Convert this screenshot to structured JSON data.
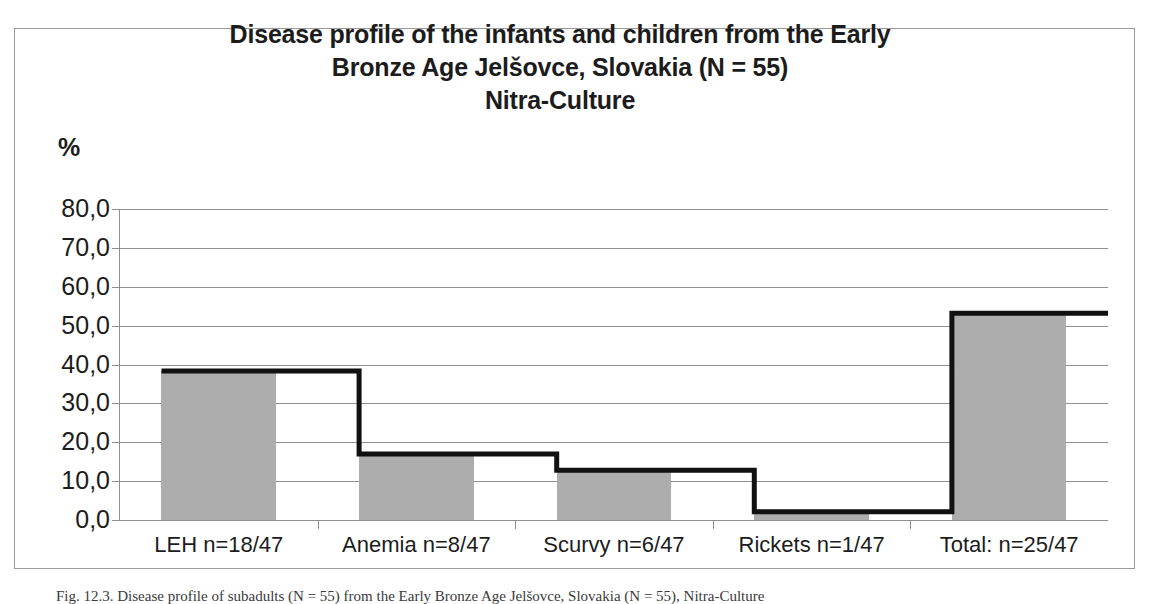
{
  "chart_data": {
    "type": "bar",
    "title": "Disease profile of the infants and children from the Early Bronze Age Jelšovce, Slovakia (N = 55) Nitra-Culture",
    "title_lines": [
      "Disease profile of the infants and children from the Early",
      "Bronze Age Jelšovce, Slovakia (N = 55)",
      "Nitra-Culture"
    ],
    "xlabel": "",
    "ylabel": "%",
    "ylim": [
      0,
      80
    ],
    "ytick_labels": [
      "80,0",
      "70,0",
      "60,0",
      "50,0",
      "40,0",
      "30,0",
      "20,0",
      "10,0",
      "0,0"
    ],
    "ytick_values": [
      80,
      70,
      60,
      50,
      40,
      30,
      20,
      10,
      0
    ],
    "grid": true,
    "legend": "none",
    "categories": [
      "LEH n=18/47",
      "Anemia n=8/47",
      "Scurvy n=6/47",
      "Rickets n=1/47",
      "Total: n=25/47"
    ],
    "series": [
      {
        "name": "percent",
        "type": "bar",
        "values": [
          38.3,
          17.0,
          12.8,
          2.1,
          53.2
        ]
      },
      {
        "name": "step-outline",
        "type": "step",
        "values": [
          38.3,
          17.0,
          12.8,
          2.1,
          53.2
        ]
      }
    ]
  },
  "figure": {
    "axis_unit": "%",
    "caption": "Fig. 12.3. Disease profile of subadults (N = 55) from the Early Bronze Age Jelšovce, Slovakia (N = 55), Nitra-Culture"
  },
  "colors": {
    "bar_fill": "#adadad",
    "step_line": "#111111",
    "grid": "#8f8f8f",
    "frame": "#9a9a9a",
    "text": "#1c1c1c"
  }
}
